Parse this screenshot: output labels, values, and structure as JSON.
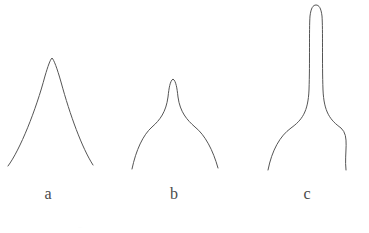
{
  "figure": {
    "background_color": "#ffffff",
    "stroke_color": "#555555",
    "stroke_width": 1,
    "width": 369,
    "height": 233
  },
  "panels": [
    {
      "id": "a",
      "label": "a",
      "description": "sharp narrow peak with concave flanks",
      "apex": {
        "x": 52,
        "y": 58
      },
      "base_left": {
        "x": 8,
        "y": 166
      },
      "base_right": {
        "x": 93,
        "y": 165
      },
      "path": "M 8,166 C 20,150 36,110 45,76 C 48,66 50,60 52,58 C 54,60 57,68 61,82 C 70,115 82,148 93,165"
    },
    {
      "id": "b",
      "label": "b",
      "description": "rounded small tip on a narrow neck flaring to a wide base",
      "apex": {
        "x": 173,
        "y": 79
      },
      "base_left": {
        "x": 132,
        "y": 169
      },
      "base_right": {
        "x": 218,
        "y": 168
      },
      "path": "M 132,169 C 136,150 143,135 152,127 C 160,120 166,112 168,97 C 169,88 170,81 173,79 C 176,81 177,88 178,97 C 180,112 187,120 195,127 C 205,135 213,150 218,168"
    },
    {
      "id": "c",
      "label": "c",
      "description": "tall narrow column with rounded top, flaring out sharply near the base",
      "apex": {
        "x": 316,
        "y": 5
      },
      "base_left": {
        "x": 268,
        "y": 170
      },
      "base_right": {
        "x": 346,
        "y": 170
      },
      "path": "M 268,170 C 272,150 280,136 291,128 C 302,120 308,112 309,90 C 310,62 309,30 310,16 C 311,8 313,5 316,5 C 319,5 321,8 322,16 C 323,30 322,62 323,90 C 324,112 330,120 341,128 C 350,136 344,152 346,170"
    }
  ],
  "caption_remnant": "..."
}
